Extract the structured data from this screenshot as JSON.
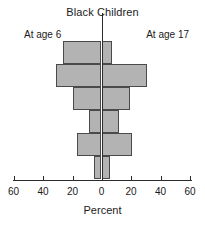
{
  "chart": {
    "title": "Black Children",
    "left_group_label": "At age 6",
    "right_group_label": "At age 17",
    "axis_title": "Percent",
    "tick_labels": [
      "60",
      "40",
      "20",
      "0",
      "20",
      "40",
      "60"
    ]
  },
  "chart_data": {
    "type": "bar",
    "title": "Black Children",
    "xlabel": "Percent",
    "ylabel": "",
    "orientation": "horizontal",
    "style": "back-to-back population pyramid",
    "grid": false,
    "legend_position": "top (side labels)",
    "xlim": [
      -60,
      60
    ],
    "x_ticks": [
      -60,
      -40,
      -20,
      0,
      20,
      40,
      60
    ],
    "x_tick_labels": [
      "60",
      "40",
      "20",
      "0",
      "20",
      "40",
      "60"
    ],
    "categories": [
      "row1",
      "row2",
      "row3",
      "row4",
      "row5",
      "row6"
    ],
    "series": [
      {
        "name": "At age 6",
        "side": "left",
        "values": [
          33,
          39,
          24,
          11,
          21,
          6
        ]
      },
      {
        "name": "At age 17",
        "side": "right",
        "values": [
          9,
          39,
          24,
          15,
          26,
          7
        ]
      }
    ],
    "bar_fill_color": "#b3b3b3",
    "bar_edge_color": "#4a4a4a",
    "axis_color": "#2b2b2b"
  },
  "geometry": {
    "zero_x": 101.5,
    "px_per_unit": 1.175,
    "row_height": 23,
    "rows_top": [
      0,
      23,
      46,
      69,
      92,
      115
    ],
    "tick_x": [
      13.5,
      43,
      72.5,
      101.5,
      131,
      160.5,
      190
    ],
    "ticks_value": [
      -60,
      -40,
      -20,
      0,
      20,
      40,
      60
    ]
  }
}
